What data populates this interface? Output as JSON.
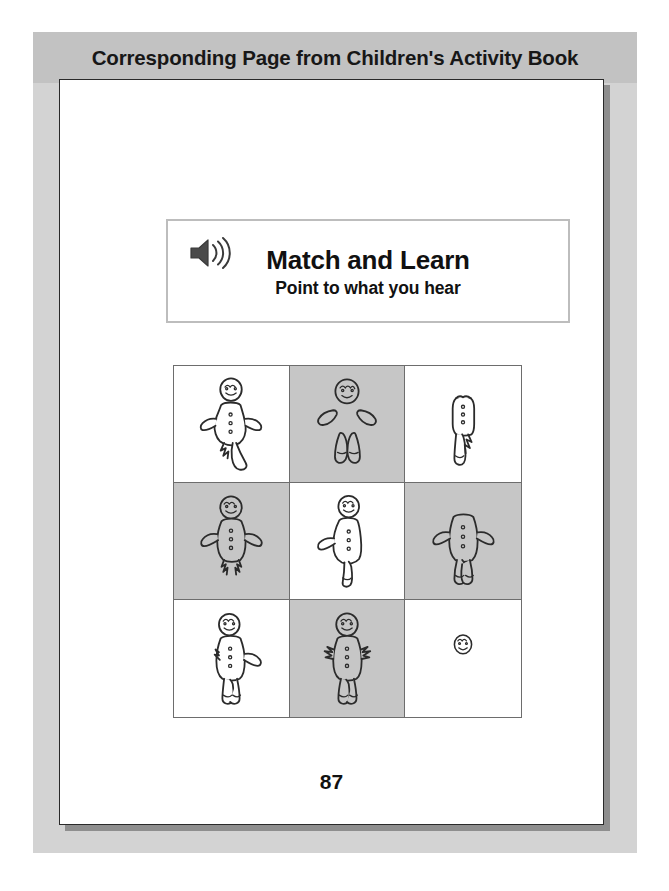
{
  "figure": {
    "banner": {
      "title": "Corresponding Page from Children's Activity Book",
      "background_color": "#c2c2c2",
      "text_color": "#171717"
    },
    "frame_color": "#d3d3d3",
    "page_background": "#ffffff",
    "page_border_color": "#2a2a2a"
  },
  "instruction": {
    "icon": "speaker-sound-icon",
    "title": "Match and Learn",
    "subtitle": "Point to what you hear",
    "border_color": "#bdbdbd"
  },
  "grid": {
    "rows": 3,
    "columns": 3,
    "shaded_color": "#c6c6c6",
    "white_color": "#ffffff",
    "line_color": "#6d6d6d",
    "cells": [
      {
        "index": 1,
        "row": 1,
        "col": 1,
        "shading": "white",
        "figure": "gingerbread-missing-one-leg",
        "description": "gingerbread figure with head, body, two arms, one leg bitten off"
      },
      {
        "index": 2,
        "row": 1,
        "col": 2,
        "shading": "shaded",
        "figure": "gingerbread-head-arms-legs-no-body",
        "description": "head, two detached arms and two detached legs, body eaten away"
      },
      {
        "index": 3,
        "row": 1,
        "col": 3,
        "shading": "white",
        "figure": "gingerbread-body-and-legs-only",
        "description": "torso and legs only, head and arms missing"
      },
      {
        "index": 4,
        "row": 2,
        "col": 1,
        "shading": "shaded",
        "figure": "gingerbread-feet-bitten-off",
        "description": "head, body, arms and legs with both feet bitten off"
      },
      {
        "index": 5,
        "row": 2,
        "col": 2,
        "shading": "white",
        "figure": "gingerbread-missing-arm-and-leg",
        "description": "head, body, one arm and one leg remaining"
      },
      {
        "index": 6,
        "row": 2,
        "col": 3,
        "shading": "shaded",
        "figure": "gingerbread-headless",
        "description": "body, arms and legs complete, head missing"
      },
      {
        "index": 7,
        "row": 3,
        "col": 1,
        "shading": "white",
        "figure": "gingerbread-missing-one-arm",
        "description": "head, body, legs and one arm, other arm bitten off"
      },
      {
        "index": 8,
        "row": 3,
        "col": 2,
        "shading": "shaded",
        "figure": "gingerbread-arms-bitten-off",
        "description": "head, body and legs with both arms bitten to jagged stubs"
      },
      {
        "index": 9,
        "row": 3,
        "col": 3,
        "shading": "white",
        "figure": "gingerbread-head-only",
        "description": "only the head remains"
      }
    ]
  },
  "page_number": "87"
}
